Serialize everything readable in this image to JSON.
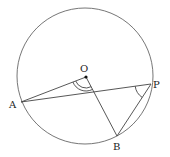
{
  "diagram": {
    "type": "circle-geometry",
    "circle": {
      "cx": 85,
      "cy": 76,
      "r": 68
    },
    "points": {
      "O": {
        "label": "O",
        "x": 86,
        "y": 77
      },
      "A": {
        "label": "A",
        "x": 21,
        "y": 102
      },
      "P": {
        "label": "P",
        "x": 151,
        "y": 84
      },
      "B": {
        "label": "B",
        "x": 117,
        "y": 136
      }
    },
    "segments": [
      [
        "O",
        "A"
      ],
      [
        "O",
        "B"
      ],
      [
        "A",
        "P"
      ],
      [
        "P",
        "B"
      ]
    ],
    "angle_marks": [
      {
        "vertex": "O",
        "between": [
          "A",
          "B"
        ],
        "arcs": 2
      },
      {
        "vertex": "P",
        "between": [
          "A",
          "B"
        ],
        "arcs": 1
      }
    ],
    "colors": {
      "line": "#444444",
      "circle": "#666666",
      "text": "#222222"
    }
  }
}
